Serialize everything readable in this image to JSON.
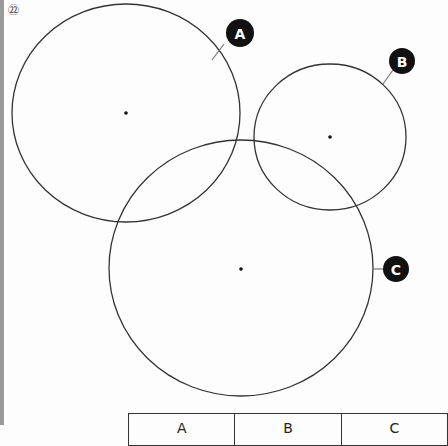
{
  "question": {
    "number": "㉒"
  },
  "circles": [
    {
      "label": "A",
      "cx": 126,
      "cy": 113,
      "rx": 114,
      "ry": 109,
      "badge": {
        "x": 240,
        "y": 33
      },
      "leader": [
        [
          224,
          44
        ],
        [
          214,
          59
        ]
      ]
    },
    {
      "label": "B",
      "cx": 330,
      "cy": 137,
      "rx": 76,
      "ry": 73,
      "badge": {
        "x": 402,
        "y": 61
      },
      "leader": [
        [
          393,
          70
        ],
        [
          384,
          82
        ]
      ]
    },
    {
      "label": "C",
      "cx": 241,
      "cy": 268,
      "rx": 132,
      "ry": 128,
      "badge": {
        "x": 395,
        "y": 269
      },
      "leader": [
        [
          374,
          269
        ],
        [
          383,
          269
        ]
      ]
    }
  ],
  "table": {
    "headers": [
      "A",
      "B",
      "C"
    ]
  },
  "colors": {
    "stroke": "#333333",
    "badge": "#111111",
    "leftbar": "#9a9a9a"
  }
}
